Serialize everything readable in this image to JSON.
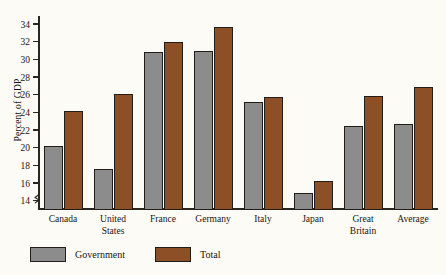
{
  "chart_data": {
    "type": "bar",
    "title": "",
    "xlabel": "",
    "ylabel": "Percent of GDP",
    "ylim": [
      13,
      35
    ],
    "yticks": [
      14,
      16,
      18,
      20,
      22,
      24,
      26,
      28,
      30,
      32,
      34
    ],
    "grid": false,
    "axis_break": true,
    "legend_position": "bottom-left",
    "categories": [
      [
        "Canada"
      ],
      [
        "United",
        "States"
      ],
      [
        "France"
      ],
      [
        "Germany"
      ],
      [
        "Italy"
      ],
      [
        "Japan"
      ],
      [
        "Great",
        "Britain"
      ],
      [
        "Average"
      ]
    ],
    "series": [
      {
        "name": "Government",
        "color": "#8c8c8c",
        "values": [
          20.3,
          17.7,
          30.9,
          31.0,
          25.2,
          14.9,
          22.5,
          22.8
        ]
      },
      {
        "name": "Total",
        "color": "#8d5026",
        "values": [
          24.2,
          26.2,
          32.1,
          33.7,
          25.8,
          16.3,
          25.9,
          26.9
        ]
      }
    ]
  },
  "legend": [
    {
      "label": "Government",
      "swatch": "gov"
    },
    {
      "label": "Total",
      "swatch": "total"
    }
  ]
}
